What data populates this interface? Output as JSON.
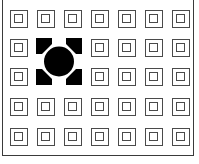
{
  "grid": {
    "columns": 7,
    "rows": 5,
    "col_x": [
      10,
      37,
      64,
      91,
      118,
      145,
      172
    ],
    "row_y": [
      10,
      39,
      68,
      98,
      128
    ]
  },
  "marker": {
    "type": "selection-target",
    "left": 36,
    "top": 38,
    "width": 46,
    "height": 47,
    "color": "#000000",
    "covers": {
      "col_start": 1,
      "col_end": 2,
      "row_start": 1,
      "row_end": 2
    }
  },
  "colors": {
    "cell_stroke": "#4a4a4a",
    "frame": "#3a3a3a",
    "background": "#ffffff"
  }
}
